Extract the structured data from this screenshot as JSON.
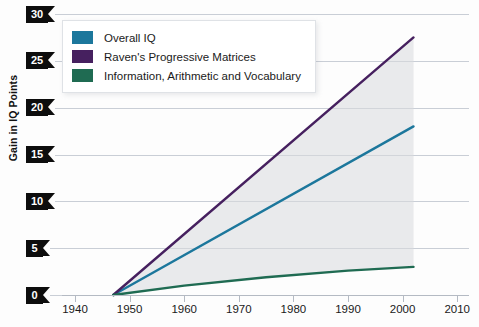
{
  "chart_data": {
    "type": "line",
    "title": "",
    "xlabel": "",
    "ylabel": "Gain in IQ Points",
    "xlim": [
      1935,
      2012
    ],
    "ylim": [
      0,
      30
    ],
    "grid": true,
    "legend_position": "top-left",
    "x_ticks": [
      1940,
      1950,
      1960,
      1970,
      1980,
      1990,
      2000,
      2010
    ],
    "y_ticks": [
      0,
      5,
      10,
      15,
      20,
      25,
      30
    ],
    "series": [
      {
        "name": "Overall IQ",
        "color": "#1c779c",
        "x": [
          1947,
          2002
        ],
        "values": [
          0,
          18
        ]
      },
      {
        "name": "Raven's Progressive Matrices",
        "color": "#46205f",
        "x": [
          1947,
          2002
        ],
        "values": [
          0,
          27.5
        ]
      },
      {
        "name": "Information, Arithmetic and Vocabulary",
        "color": "#1f6b52",
        "x": [
          1947,
          1960,
          1975,
          1990,
          2002
        ],
        "values": [
          0,
          1.0,
          1.9,
          2.6,
          3.0
        ]
      }
    ]
  },
  "axes": {
    "y_title": "Gain in IQ Points",
    "y_labels": [
      "30",
      "25",
      "20",
      "15",
      "10",
      "5",
      "0"
    ],
    "x_labels": [
      "1940",
      "1950",
      "1960",
      "1970",
      "1980",
      "1990",
      "2000",
      "2010"
    ]
  },
  "legend": {
    "items": [
      {
        "label": "Overall IQ",
        "color": "#1c779c"
      },
      {
        "label": "Raven's Progressive Matrices",
        "color": "#46205f"
      },
      {
        "label": "Information, Arithmetic and Vocabulary",
        "color": "#1f6b52"
      }
    ]
  },
  "colors": {
    "gridline": "#c9ced6",
    "axis": "#b4bac3",
    "label_chip": "#0d0d0d",
    "band_fill": "#d8dade"
  }
}
